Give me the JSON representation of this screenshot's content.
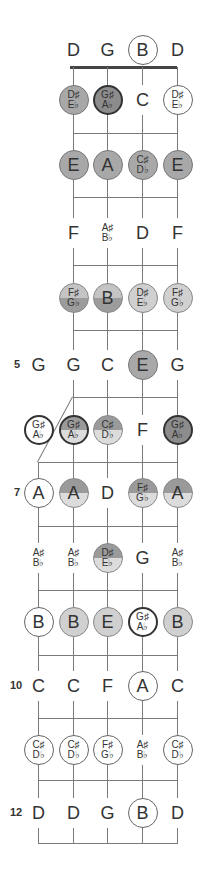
{
  "diagram": {
    "title": "",
    "instrument": "5-string banjo fretboard, open G tuning",
    "open_strings": [
      "D",
      "G",
      "B",
      "D"
    ],
    "fifth_string_start_fret": 5,
    "fret_numbers": [
      {
        "fret": 5,
        "label": "5"
      },
      {
        "fret": 7,
        "label": "7"
      },
      {
        "fret": 10,
        "label": "10"
      },
      {
        "fret": 12,
        "label": "12"
      }
    ],
    "rows": [
      {
        "fret": 0,
        "notes": [
          {
            "s": 4,
            "top": "D",
            "style": "plain"
          },
          {
            "s": 3,
            "top": "G",
            "style": "plain"
          },
          {
            "s": 2,
            "top": "B",
            "style": "circled"
          },
          {
            "s": 1,
            "top": "D",
            "style": "plain"
          }
        ]
      },
      {
        "fret": 1,
        "notes": [
          {
            "s": 4,
            "top": "D♯",
            "bottom": "E♭",
            "style": "fill-mid"
          },
          {
            "s": 3,
            "top": "G♯",
            "bottom": "A♭",
            "style": "fill-dark"
          },
          {
            "s": 2,
            "top": "C",
            "style": "plain"
          },
          {
            "s": 1,
            "top": "D♯",
            "bottom": "E♭",
            "style": "circled"
          }
        ]
      },
      {
        "fret": 2,
        "notes": [
          {
            "s": 4,
            "top": "E",
            "style": "fill-mid"
          },
          {
            "s": 3,
            "top": "A",
            "style": "fill-mid"
          },
          {
            "s": 2,
            "top": "C♯",
            "bottom": "D♭",
            "style": "fill-mid"
          },
          {
            "s": 1,
            "top": "E",
            "style": "fill-mid"
          }
        ]
      },
      {
        "fret": 3,
        "notes": [
          {
            "s": 4,
            "top": "F",
            "style": "plain"
          },
          {
            "s": 3,
            "top": "A♯",
            "bottom": "B♭",
            "style": "plain"
          },
          {
            "s": 2,
            "top": "D",
            "style": "plain"
          },
          {
            "s": 1,
            "top": "F",
            "style": "plain"
          }
        ]
      },
      {
        "fret": 4,
        "notes": [
          {
            "s": 4,
            "top": "F♯",
            "bottom": "G♭",
            "style": "split-lt"
          },
          {
            "s": 3,
            "top": "B",
            "style": "split-lt"
          },
          {
            "s": 2,
            "top": "D♯",
            "bottom": "E♭",
            "style": "fill-light"
          },
          {
            "s": 1,
            "top": "F♯",
            "bottom": "G♭",
            "style": "fill-light"
          }
        ]
      },
      {
        "fret": 5,
        "notes": [
          {
            "s": 5,
            "top": "G",
            "style": "plain"
          },
          {
            "s": 4,
            "top": "G",
            "style": "plain"
          },
          {
            "s": 3,
            "top": "C",
            "style": "plain"
          },
          {
            "s": 2,
            "top": "E",
            "style": "fill-mid"
          },
          {
            "s": 1,
            "top": "G",
            "style": "plain"
          }
        ]
      },
      {
        "fret": 6,
        "notes": [
          {
            "s": 5,
            "top": "G♯",
            "bottom": "A♭",
            "style": "heavy"
          },
          {
            "s": 4,
            "top": "G♯",
            "bottom": "A♭",
            "style": "split-dt-heavy"
          },
          {
            "s": 3,
            "top": "C♯",
            "bottom": "D♭",
            "style": "split-dt"
          },
          {
            "s": 2,
            "top": "F",
            "style": "plain"
          },
          {
            "s": 1,
            "top": "G♯",
            "bottom": "A♭",
            "style": "fill-dark"
          }
        ]
      },
      {
        "fret": 7,
        "notes": [
          {
            "s": 5,
            "top": "A",
            "style": "circled"
          },
          {
            "s": 4,
            "top": "A",
            "style": "split-dt"
          },
          {
            "s": 3,
            "top": "D",
            "style": "plain"
          },
          {
            "s": 2,
            "top": "F♯",
            "bottom": "G♭",
            "style": "split-dt"
          },
          {
            "s": 1,
            "top": "A",
            "style": "split-dt"
          }
        ]
      },
      {
        "fret": 8,
        "notes": [
          {
            "s": 5,
            "top": "A♯",
            "bottom": "B♭",
            "style": "plain"
          },
          {
            "s": 4,
            "top": "A♯",
            "bottom": "B♭",
            "style": "plain"
          },
          {
            "s": 3,
            "top": "D♯",
            "bottom": "E♭",
            "style": "split-dt"
          },
          {
            "s": 2,
            "top": "G",
            "style": "plain"
          },
          {
            "s": 1,
            "top": "A♯",
            "bottom": "B♭",
            "style": "plain"
          }
        ]
      },
      {
        "fret": 9,
        "notes": [
          {
            "s": 5,
            "top": "B",
            "style": "circled"
          },
          {
            "s": 4,
            "top": "B",
            "style": "fill-light"
          },
          {
            "s": 3,
            "top": "E",
            "style": "fill-light"
          },
          {
            "s": 2,
            "top": "G♯",
            "bottom": "A♭",
            "style": "heavy"
          },
          {
            "s": 1,
            "top": "B",
            "style": "fill-light"
          }
        ]
      },
      {
        "fret": 10,
        "notes": [
          {
            "s": 5,
            "top": "C",
            "style": "plain"
          },
          {
            "s": 4,
            "top": "C",
            "style": "plain"
          },
          {
            "s": 3,
            "top": "F",
            "style": "plain"
          },
          {
            "s": 2,
            "top": "A",
            "style": "circled"
          },
          {
            "s": 1,
            "top": "C",
            "style": "plain"
          }
        ]
      },
      {
        "fret": 11,
        "notes": [
          {
            "s": 5,
            "top": "C♯",
            "bottom": "D♭",
            "style": "circled"
          },
          {
            "s": 4,
            "top": "C♯",
            "bottom": "D♭",
            "style": "circled"
          },
          {
            "s": 3,
            "top": "F♯",
            "bottom": "G♭",
            "style": "circled"
          },
          {
            "s": 2,
            "top": "A♯",
            "bottom": "B♭",
            "style": "plain"
          },
          {
            "s": 1,
            "top": "C♯",
            "bottom": "D♭",
            "style": "circled"
          }
        ]
      },
      {
        "fret": 12,
        "notes": [
          {
            "s": 5,
            "top": "D",
            "style": "plain"
          },
          {
            "s": 4,
            "top": "D",
            "style": "plain"
          },
          {
            "s": 3,
            "top": "G",
            "style": "plain"
          },
          {
            "s": 2,
            "top": "B",
            "style": "circled"
          },
          {
            "s": 1,
            "top": "D",
            "style": "plain"
          }
        ]
      }
    ]
  }
}
